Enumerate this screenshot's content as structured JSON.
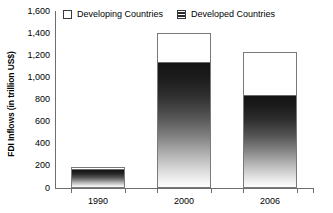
{
  "chart_data": {
    "type": "bar",
    "stacked": true,
    "title": "",
    "xlabel": "",
    "ylabel": "FDI Inflows (in trillion US$)",
    "categories": [
      "1990",
      "2000",
      "2006"
    ],
    "series": [
      {
        "name": "Developed Countries",
        "style": "gradient-dark",
        "values": [
          165,
          1130,
          830
        ]
      },
      {
        "name": "Developing Countries",
        "style": "white",
        "values": [
          25,
          270,
          400
        ]
      }
    ],
    "totals": [
      190,
      1400,
      1230
    ],
    "ylim": [
      0,
      1600
    ],
    "ytick_values": [
      0,
      200,
      400,
      600,
      800,
      1000,
      1200,
      1400,
      1600
    ],
    "ytick_labels": [
      "0",
      "200",
      "400",
      "600",
      "800",
      "1,000",
      "1,200",
      "1,400",
      "1,600"
    ],
    "grid": false,
    "legend_position": "top-inside"
  },
  "legend": {
    "items": [
      {
        "label": "Developing Countries",
        "swatch": "white-box-icon"
      },
      {
        "label": "Developed Countries",
        "swatch": "hatched-box-icon"
      }
    ]
  },
  "axis": {
    "y_title": "FDI Inflows (in trillion US$)"
  }
}
